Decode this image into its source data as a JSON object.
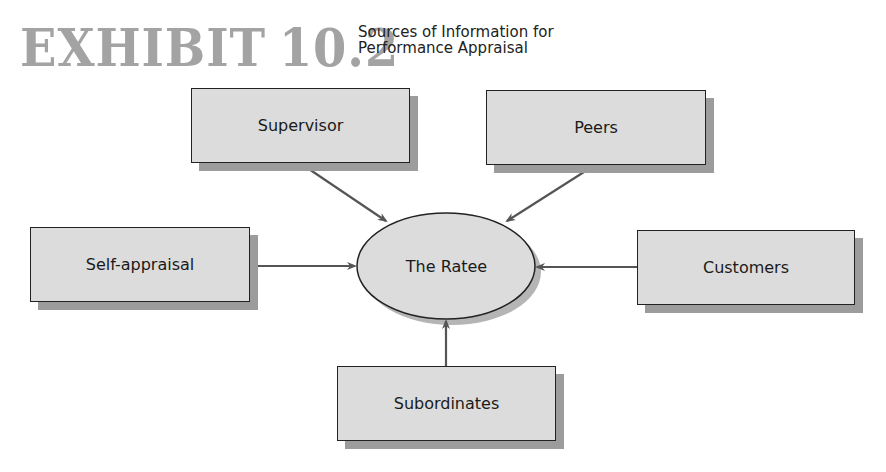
{
  "exhibit": {
    "label": "EXHIBIT",
    "number": "10.2",
    "title_line1": "Sources of Information for",
    "title_line2": "Performance Appraisal"
  },
  "diagram": {
    "center": {
      "label": "The Ratee"
    },
    "sources": [
      {
        "id": "supervisor",
        "label": "Supervisor"
      },
      {
        "id": "peers",
        "label": "Peers"
      },
      {
        "id": "self-appraisal",
        "label": "Self-appraisal"
      },
      {
        "id": "customers",
        "label": "Customers"
      },
      {
        "id": "subordinates",
        "label": "Subordinates"
      }
    ],
    "colors": {
      "box_fill": "#dcdcdc",
      "box_shadow": "#9c9c9c",
      "border": "#222222",
      "arrow": "#555555",
      "exhibit_text": "#a3a3a3"
    }
  }
}
